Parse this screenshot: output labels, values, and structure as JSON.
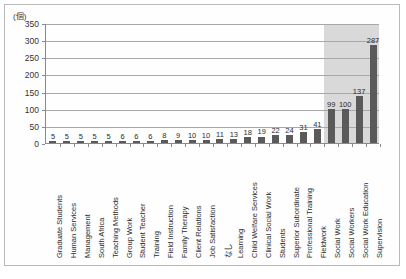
{
  "chart": {
    "unit_label": "(個)",
    "type": "bar"
  },
  "chart_data": {
    "type": "bar",
    "title": "",
    "xlabel": "",
    "ylabel": "(個)",
    "ylim": [
      0,
      350
    ],
    "yticks": [
      0,
      50,
      100,
      150,
      200,
      250,
      300,
      350
    ],
    "grid": true,
    "legend": false,
    "bar_color": "#5a5a5a",
    "highlight_color": "#d2d2d2",
    "highlight_categories": [
      "Social Work",
      "Social Workers",
      "Social Work Education",
      "Supervision"
    ],
    "categories": [
      "Graduate Students",
      "Human Services",
      "Management",
      "South Africa",
      "Teaching Methods",
      "Group Work",
      "Student Teacher",
      "Training",
      "Field Instruction",
      "Family Therapy",
      "Client Relations",
      "Job Satisfaction",
      "なし",
      "Learning",
      "Child Welfare Services",
      "Clinical Social Work",
      "Students",
      "Superior Subordinate",
      "Professional Training",
      "Fieldwork",
      "Social Work",
      "Social Workers",
      "Social Work Education",
      "Supervision"
    ],
    "values": [
      5,
      5,
      5,
      5,
      5,
      6,
      6,
      6,
      8,
      9,
      10,
      10,
      11,
      13,
      18,
      19,
      22,
      24,
      31,
      41,
      99,
      100,
      137,
      287
    ]
  }
}
